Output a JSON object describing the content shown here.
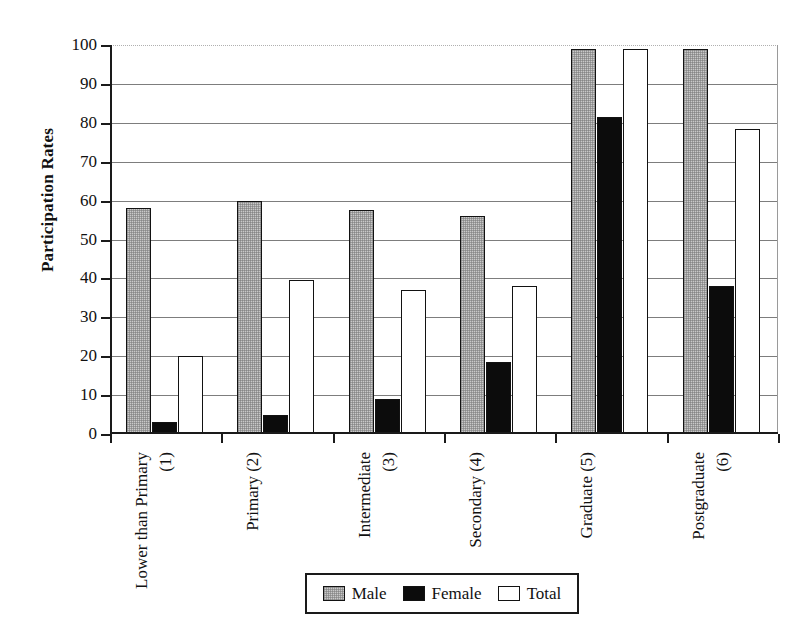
{
  "chart_data": {
    "type": "bar",
    "title": "",
    "subtitle": "",
    "xlabel": "",
    "ylabel": "Participation Rates",
    "ylim": [
      0,
      100
    ],
    "ytick_values": [
      0,
      10,
      20,
      30,
      40,
      50,
      60,
      70,
      80,
      90,
      100
    ],
    "ytick_labels": [
      "0",
      "10",
      "20",
      "30",
      "40",
      "50",
      "60",
      "70",
      "80",
      "90",
      "100"
    ],
    "grid": "horizontal",
    "legend_position": "bottom-center",
    "categories": [
      "Lower than Primary (1)",
      "Primary (2)",
      "Intermediate (3)",
      "Secondary (4)",
      "Graduate (5)",
      "Postgraduate (6)"
    ],
    "category_lines": [
      [
        "Lower than Primary",
        "(1)"
      ],
      [
        "Primary (2)",
        ""
      ],
      [
        "Intermediate",
        "(3)"
      ],
      [
        "Secondary (4)",
        ""
      ],
      [
        "Graduate (5)",
        ""
      ],
      [
        "Postgraduate",
        "(6)"
      ]
    ],
    "series": [
      {
        "name": "Male",
        "color": "#c9c9c9",
        "values": [
          58,
          60,
          57.5,
          56,
          99,
          99
        ]
      },
      {
        "name": "Female",
        "color": "#0c0c0c",
        "values": [
          3,
          5,
          9,
          18.5,
          81.5,
          38
        ]
      },
      {
        "name": "Total",
        "color": "#ffffff",
        "values": [
          20,
          39.5,
          37,
          38,
          99,
          78.5
        ]
      }
    ],
    "legend": [
      "Male",
      "Female",
      "Total"
    ]
  }
}
